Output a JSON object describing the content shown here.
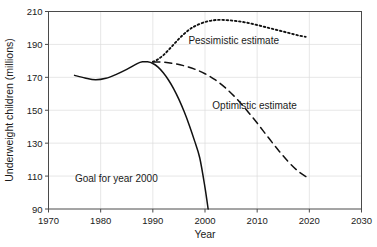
{
  "chart_data": {
    "type": "line",
    "title": "",
    "xlabel": "Year",
    "ylabel": "Underweight children (millions)",
    "xlim": [
      1970,
      2030
    ],
    "ylim": [
      90,
      210
    ],
    "xticks": [
      1970,
      1980,
      1990,
      2000,
      2010,
      2020,
      2030
    ],
    "yticks": [
      90,
      110,
      130,
      150,
      170,
      190,
      210
    ],
    "xtick_labels": [
      "1970",
      "1980",
      "1990",
      "2000",
      "2010",
      "2020",
      "2030"
    ],
    "ytick_labels": [
      "90",
      "110",
      "130",
      "150",
      "170",
      "190",
      "210"
    ],
    "grid": true,
    "legend": "inline-annotations",
    "series": [
      {
        "name": "Goal for year 2000",
        "style": "solid",
        "x": [
          1975,
          1977,
          1979,
          1981,
          1983,
          1985,
          1987,
          1988,
          1989,
          1990,
          1991,
          1992,
          1993,
          1994,
          1995,
          1996,
          1997,
          1998,
          1999,
          2000,
          2000.6
        ],
        "values": [
          171.2,
          169.6,
          168.5,
          169.4,
          171.8,
          174.8,
          178.3,
          179.4,
          179.4,
          178.4,
          176.2,
          172.8,
          168.4,
          163.0,
          156.6,
          149.2,
          140.8,
          131.4,
          121.0,
          103.0,
          90.0
        ]
      },
      {
        "name": "Pessimistic estimate",
        "style": "dotted",
        "x": [
          1990,
          1991,
          1992,
          1993,
          1994,
          1995,
          1996,
          1997,
          1998,
          2000,
          2002,
          2004,
          2006,
          2008,
          2010,
          2012,
          2014,
          2016,
          2018,
          2019.3
        ],
        "values": [
          179.4,
          181.0,
          183.4,
          186.6,
          190.0,
          193.4,
          196.4,
          199.0,
          201.0,
          203.6,
          204.8,
          204.8,
          204.2,
          203.2,
          201.8,
          200.2,
          198.6,
          197.0,
          195.4,
          194.6
        ]
      },
      {
        "name": "Optimistic estimate",
        "style": "dashed",
        "x": [
          1990,
          1992,
          1994,
          1996,
          1998,
          2000,
          2002,
          2004,
          2006,
          2008,
          2010,
          2012,
          2014,
          2016,
          2018,
          2020
        ],
        "values": [
          179.4,
          179.2,
          178.4,
          177.0,
          175.0,
          172.2,
          168.4,
          163.4,
          157.2,
          150.0,
          142.2,
          134.0,
          126.0,
          118.6,
          112.6,
          108.4
        ]
      }
    ],
    "annotations": [
      {
        "text": "Pessimistic estimate",
        "x": 2005.5,
        "y": 190.5
      },
      {
        "text": "Optimistic estimate",
        "x": 2009.5,
        "y": 151.0
      },
      {
        "text": "Goal for year 2000",
        "x": 1983.0,
        "y": 106.5
      }
    ]
  }
}
